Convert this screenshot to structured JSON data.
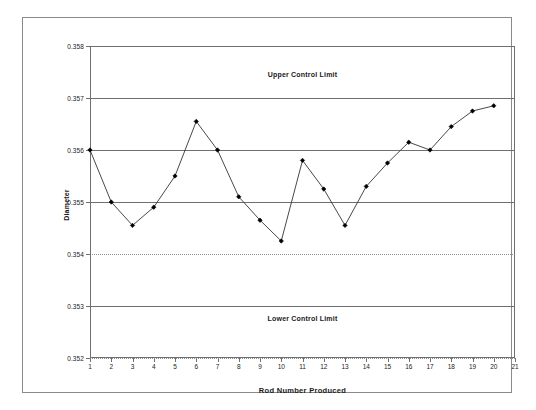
{
  "chart_data": {
    "type": "line",
    "title": "",
    "xlabel": "Rod Number Produced",
    "ylabel": "Diameter",
    "xlim": [
      1,
      21
    ],
    "ylim": [
      0.352,
      0.358
    ],
    "xticks": [
      "1",
      "2",
      "3",
      "4",
      "5",
      "6",
      "7",
      "8",
      "9",
      "10",
      "11",
      "12",
      "13",
      "14",
      "15",
      "16",
      "17",
      "18",
      "19",
      "20",
      "21"
    ],
    "yticks": [
      "0.352",
      "0.353",
      "0.354",
      "0.355",
      "0.356",
      "0.357",
      "0.358"
    ],
    "ytick_values": [
      0.352,
      0.353,
      0.354,
      0.355,
      0.356,
      0.357,
      0.358
    ],
    "grid": true,
    "grid_styles": {
      "0.358": "solid",
      "0.357": "solid",
      "0.356": "solid",
      "0.355": "solid",
      "0.354": "dotted",
      "0.353": "solid",
      "0.352": "dotted"
    },
    "legend": "none",
    "marker": "diamond",
    "line_color": "#333333",
    "marker_color": "#000000",
    "x": [
      1,
      2,
      3,
      4,
      5,
      6,
      7,
      8,
      9,
      10,
      11,
      12,
      13,
      14,
      15,
      16,
      17,
      18,
      19,
      20
    ],
    "values": [
      0.356,
      0.355,
      0.35455,
      0.3549,
      0.3555,
      0.35655,
      0.356,
      0.3551,
      0.35465,
      0.35425,
      0.3558,
      0.35525,
      0.35455,
      0.3553,
      0.35575,
      0.35615,
      0.356,
      0.35645,
      0.35675,
      0.35685
    ],
    "annotations": [
      {
        "text": "Upper Control Limit",
        "x": 11.0,
        "y": 0.35745
      },
      {
        "text": "Lower Control Limit",
        "x": 11.0,
        "y": 0.35275
      }
    ]
  },
  "axis_titles": {
    "x": "Rod Number Produced",
    "y": "Diameter"
  }
}
